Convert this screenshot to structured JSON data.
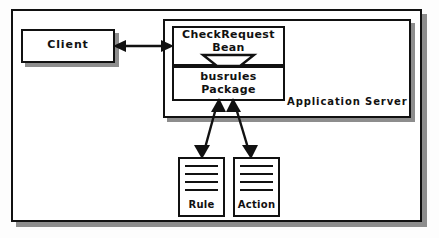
{
  "diagram": {
    "title_text": "",
    "colors": {
      "background": "#fdfdfd",
      "stroke": "#111111",
      "shadow": "#8d8d8d",
      "fill": "#ffffff"
    },
    "outer_frame": {
      "name": "diagram-outer-frame"
    },
    "nodes": {
      "client": {
        "label": "Client"
      },
      "app_server": {
        "label": "Application Server"
      },
      "bean": {
        "label_line1": "CheckRequest",
        "label_line2": "Bean",
        "label": "CheckRequest Bean"
      },
      "package": {
        "label_line1": "busrules",
        "label_line2": "Package",
        "label": "busrules Package"
      },
      "rule": {
        "label": "Rule",
        "line_count": 4
      },
      "action": {
        "label": "Action",
        "line_count": 4
      }
    },
    "connectors": [
      {
        "id": "client-bean",
        "from": "client",
        "to": "bean",
        "style": "double-headed-arrow",
        "orientation": "horizontal"
      },
      {
        "id": "bean-package",
        "from": "bean",
        "to": "package",
        "style": "hollow-arrowhead",
        "orientation": "vertical"
      },
      {
        "id": "package-rule",
        "from": "package",
        "to": "rule",
        "style": "double-headed-arrow",
        "orientation": "diagonal"
      },
      {
        "id": "package-action",
        "from": "package",
        "to": "action",
        "style": "double-headed-arrow",
        "orientation": "diagonal"
      }
    ]
  }
}
